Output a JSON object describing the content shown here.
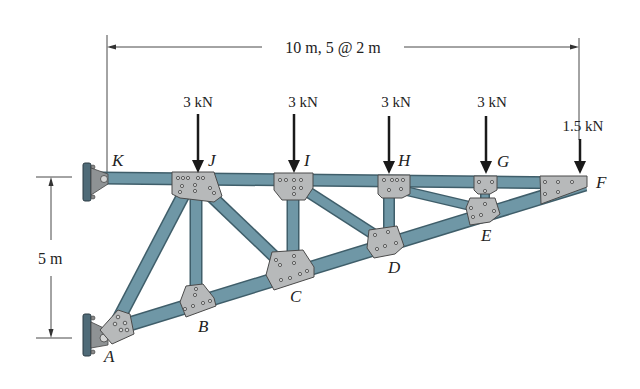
{
  "figure": {
    "dimensions": {
      "horizontal": "10 m, 5 @ 2 m",
      "vertical": "5 m"
    },
    "joints": {
      "A": "A",
      "B": "B",
      "C": "C",
      "D": "D",
      "E": "E",
      "F": "F",
      "G": "G",
      "H": "H",
      "I": "I",
      "J": "J",
      "K": "K"
    },
    "loads": [
      {
        "joint": "J",
        "label": "3 kN"
      },
      {
        "joint": "I",
        "label": "3 kN"
      },
      {
        "joint": "H",
        "label": "3 kN"
      },
      {
        "joint": "G",
        "label": "3 kN"
      },
      {
        "joint": "F",
        "label": "1.5 kN"
      }
    ],
    "supports": [
      {
        "joint": "K",
        "type": "pin-to-wall"
      },
      {
        "joint": "A",
        "type": "pin-to-wall"
      }
    ],
    "members": [
      "KJ",
      "JI",
      "IH",
      "HG",
      "GF",
      "AB",
      "BC",
      "CD",
      "DE",
      "EF",
      "AJ",
      "JB",
      "JC",
      "IC",
      "ID",
      "HD",
      "HE",
      "GE"
    ],
    "colors": {
      "member": "#6f97a6",
      "plate": "#b7b9ba",
      "wall": "#4f6b78",
      "text": "#222222"
    }
  }
}
